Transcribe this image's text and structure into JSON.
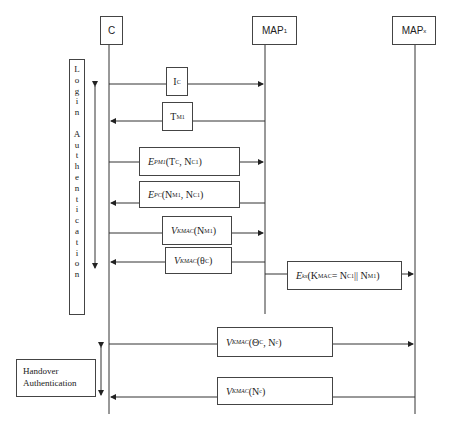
{
  "participants": [
    {
      "id": "C",
      "label": "C",
      "subscript": ""
    },
    {
      "id": "MAP1",
      "label": "MAP",
      "subscript": "1"
    },
    {
      "id": "MAPx",
      "label": "MAP",
      "subscript": "x"
    }
  ],
  "phases": {
    "login": {
      "label": "Login Authentication",
      "letters": [
        "L",
        "o",
        "g",
        "i",
        "n",
        "",
        "A",
        "u",
        "t",
        "h",
        "e",
        "n",
        "t",
        "i",
        "c",
        "a",
        "t",
        "i",
        "o",
        "n"
      ]
    },
    "handover": {
      "line1": "Handover",
      "line2": "Authentication"
    }
  },
  "messages": [
    {
      "from": "C",
      "to": "MAP1",
      "base": "I",
      "sub": "C",
      "args": ""
    },
    {
      "from": "MAP1",
      "to": "C",
      "base": "T",
      "sub": "M1",
      "args": ""
    },
    {
      "from": "C",
      "to": "MAP1",
      "base": "E",
      "sub": "PM1",
      "args": "(T",
      "args_sub": "C",
      "args_rest": ", N",
      "args_sub2": "C1",
      "args_end": ")"
    },
    {
      "from": "MAP1",
      "to": "C",
      "base": "E",
      "sub": "PC",
      "args": "(N",
      "args_sub": "M1",
      "args_rest": ", N",
      "args_sub2": "C1",
      "args_end": ")"
    },
    {
      "from": "C",
      "to": "MAP1",
      "base": "V",
      "sub": "KMAC",
      "args": "(N",
      "args_sub": "M1",
      "args_end": ")"
    },
    {
      "from": "MAP1",
      "to": "C",
      "base": "V",
      "sub": "KMAC",
      "args": "(θ",
      "args_sub": "C",
      "args_end": ")"
    },
    {
      "from": "MAP1",
      "to": "MAPx",
      "base": "E",
      "sub": "kx",
      "args": "(K",
      "args_sub": "MAC",
      "args_rest": " = N",
      "args_sub2": "C1",
      "args_rest2": " || N",
      "args_sub3": "M1",
      "args_end": ")"
    },
    {
      "from": "C",
      "to": "MAPx",
      "base": "V",
      "sub": "KMAC",
      "args": "(Θ",
      "args_sub": "C",
      "args_rest": ", N",
      "args_sub2": "c",
      "args_end": ")"
    },
    {
      "from": "MAPx",
      "to": "C",
      "base": "V",
      "sub": "KMAC",
      "args": "(N",
      "args_sub": "c",
      "args_end": ")"
    }
  ]
}
